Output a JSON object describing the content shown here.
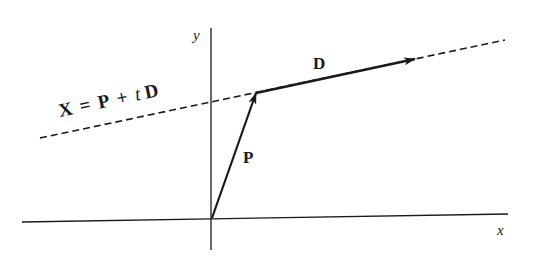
{
  "diagram": {
    "axes": {
      "x_label": "x",
      "y_label": "y"
    },
    "line": {
      "equation_parts": {
        "X": "X",
        "eq": "=",
        "P": "P",
        "plus": "+",
        "t": "t",
        "D": "D"
      },
      "style": "dashed"
    },
    "vectors": [
      {
        "name": "P",
        "label": "P",
        "from": "origin",
        "to": "point on line"
      },
      {
        "name": "D",
        "label": "D",
        "from": "P",
        "direction": "along line"
      }
    ],
    "colors": {
      "ink": "#1a1a1a",
      "background": "#ffffff"
    }
  }
}
